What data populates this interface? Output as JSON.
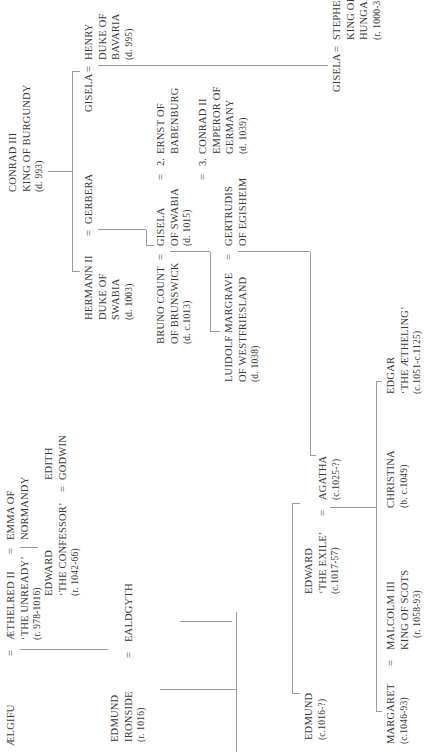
{
  "diagram": {
    "orientation": "rotated-90-ccw",
    "people": {
      "aelgifu": {
        "lines": [
          "ÆLGIFU"
        ]
      },
      "aethelred": {
        "lines": [
          "ÆTHELRED II",
          "‘THE UNREADY’"
        ],
        "dates": "(r. 978-1016)"
      },
      "emma": {
        "lines": [
          "EMMA OF",
          "NORMANDY"
        ]
      },
      "edward_confessor": {
        "lines": [
          "EDWARD",
          "‘THE CONFESSOR’"
        ],
        "dates": "(r. 1042-66)"
      },
      "edith": {
        "lines": [
          "EDITH",
          "GODWIN"
        ]
      },
      "edmund_ironside": {
        "lines": [
          "EDMUND",
          "IRONSIDE"
        ],
        "dates": "(r. 1016)"
      },
      "ealdgyth": {
        "lines": [
          "EALDGYTH"
        ]
      },
      "edmund_son": {
        "lines": [
          "EDMUND"
        ],
        "dates": "(c.1016-?)"
      },
      "edward_exile": {
        "lines": [
          "EDWARD",
          "‘THE EXILE’"
        ],
        "dates": "(c.1017-57)"
      },
      "agatha": {
        "lines": [
          "AGATHA"
        ],
        "dates": "(c.1025-?)"
      },
      "margaret": {
        "lines": [
          "MARGARET"
        ],
        "dates": "(c.1046-93)"
      },
      "malcolm": {
        "lines": [
          "MALCOLM III",
          "KING OF SCOTS"
        ],
        "dates": "(r. 1058-93)"
      },
      "christina": {
        "lines": [
          "CHRISTINA"
        ],
        "dates": "(b. c.1049)"
      },
      "edgar": {
        "lines": [
          "EDGAR",
          "‘THE ÆTHELING’"
        ],
        "dates": "(c.1051-c.1125)"
      },
      "conrad3": {
        "lines": [
          "CONRAD III",
          "KING OF BURGUNDY"
        ],
        "dates": "(d. 993)"
      },
      "hermann": {
        "lines": [
          "HERMANN II",
          "DUKE OF",
          "SWABIA"
        ],
        "dates": "(d. 1003)"
      },
      "gerbera": {
        "lines": [
          "GERBERA"
        ]
      },
      "gisela_bav": {
        "lines": [
          "GISELA"
        ]
      },
      "henry": {
        "lines": [
          "HENRY",
          "DUKE OF",
          "BAVARIA"
        ],
        "dates": "(d. 995)"
      },
      "bruno": {
        "lines": [
          "BRUNO COUNT",
          "OF BRUNSWICK"
        ],
        "dates": "(d. c.1013)"
      },
      "gisela_swabia": {
        "lines": [
          "GISELA",
          "OF SWABIA"
        ],
        "dates": "(d. 1015)"
      },
      "ernst": {
        "num": "2.",
        "lines": [
          "ERNST OF",
          "BABENBURG"
        ]
      },
      "conrad2": {
        "num": "3.",
        "lines": [
          "CONRAD II",
          "EMPEROR OF",
          "GERMANY"
        ],
        "dates": "(d. 1039)"
      },
      "liudolf": {
        "lines": [
          "LUIDOLF MARGRAVE",
          "OF WESTFRIESLAND"
        ],
        "dates": "(d. 1038)"
      },
      "gertrudis": {
        "lines": [
          "GERTRUDIS",
          "OF EGISHEIM"
        ]
      },
      "gisela_hun": {
        "lines": [
          "GISELA"
        ]
      },
      "stephen": {
        "lines": [
          "STEPHEN I",
          "KING OF",
          "HUNGARY"
        ],
        "dates": "(r. 1000-38)"
      }
    },
    "marriage_symbol": "=",
    "line_color": "#9a9a9a",
    "text_color": "#3a3a3a"
  }
}
